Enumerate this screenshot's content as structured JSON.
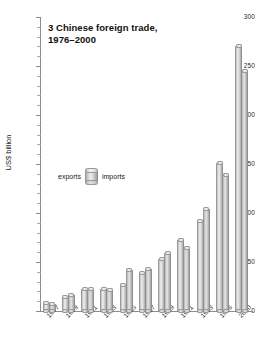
{
  "chart_data": {
    "type": "bar",
    "title": "3 Chinese foreign trade,\n1976–2000",
    "xlabel": "",
    "ylabel": "US$ billion",
    "ylim": [
      0,
      300
    ],
    "ytick_step": 50,
    "ytick_minor_step": 10,
    "grid": false,
    "legend_position": "inside-left",
    "categories": [
      "1977",
      "1979",
      "1981",
      "1983",
      "1985",
      "1987",
      "1989",
      "1991",
      "1993",
      "1996",
      "2000"
    ],
    "series": [
      {
        "name": "exports",
        "values": [
          8,
          14,
          22,
          22,
          27,
          39,
          53,
          72,
          92,
          151,
          270
        ]
      },
      {
        "name": "imports",
        "values": [
          7,
          16,
          22,
          21,
          42,
          43,
          59,
          64,
          104,
          139,
          245
        ]
      }
    ]
  },
  "axes": {
    "y_tick_labels": [
      "300",
      "250",
      "200",
      "150",
      "100",
      "50",
      "0"
    ],
    "y_axis_title": "US$ billion"
  },
  "legend": {
    "exports_label": "exports",
    "imports_label": "imports",
    "swatch_icon": "cylinder-icon"
  }
}
